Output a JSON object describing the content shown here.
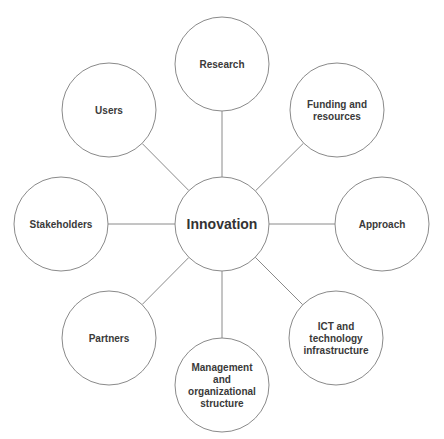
{
  "diagram": {
    "type": "hub-and-spoke",
    "center": {
      "label": "Innovation",
      "cx": 222,
      "cy": 224,
      "r": 47
    },
    "nodes": [
      {
        "id": "research",
        "lines": [
          "Research"
        ],
        "cx": 222,
        "cy": 64,
        "r": 47
      },
      {
        "id": "funding",
        "lines": [
          "Funding and",
          "resources"
        ],
        "cx": 337,
        "cy": 110,
        "r": 47
      },
      {
        "id": "approach",
        "lines": [
          "Approach"
        ],
        "cx": 382,
        "cy": 224,
        "r": 47
      },
      {
        "id": "ict",
        "lines": [
          "ICT and",
          "technology",
          "infrastructure"
        ],
        "cx": 336,
        "cy": 338,
        "r": 47
      },
      {
        "id": "management",
        "lines": [
          "Management",
          "and",
          "organizational",
          "structure"
        ],
        "cx": 222,
        "cy": 385,
        "r": 47
      },
      {
        "id": "partners",
        "lines": [
          "Partners"
        ],
        "cx": 109,
        "cy": 338,
        "r": 47
      },
      {
        "id": "stakeholders",
        "lines": [
          "Stakeholders"
        ],
        "cx": 61,
        "cy": 224,
        "r": 47
      },
      {
        "id": "users",
        "lines": [
          "Users"
        ],
        "cx": 109,
        "cy": 110,
        "r": 47
      }
    ],
    "colors": {
      "stroke": "#8a8a8a",
      "text": "#3a3a3a",
      "fill": "#ffffff"
    }
  }
}
